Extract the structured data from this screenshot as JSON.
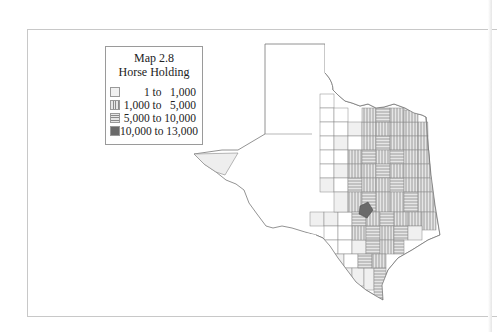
{
  "map": {
    "title": "Map 2.8",
    "subtitle": "Horse Holding",
    "region": "Texas counties",
    "legend": [
      {
        "label": "    1 to   1,000",
        "pattern": "light",
        "color": "#f0f0f0"
      },
      {
        "label": "1,000 to   5,000",
        "pattern": "vertical-lines",
        "color": "#cfcfcf"
      },
      {
        "label": "5,000 to 10,000",
        "pattern": "horizontal-lines",
        "color": "#c4c4c4"
      },
      {
        "label": "10,000 to 13,000",
        "pattern": "solid-dark",
        "color": "#6a6a6a"
      }
    ]
  }
}
